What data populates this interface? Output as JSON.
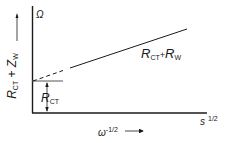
{
  "diagram": {
    "y_axis": {
      "unit": "Ω",
      "label_main": "R",
      "label_sub1": "CT",
      "label_plus": " + ",
      "label_main2": "Z",
      "label_sub2": "W"
    },
    "x_axis": {
      "label_main": "ω",
      "label_sup": "-1/2",
      "unit_main": "s",
      "unit_sup": "1/2"
    },
    "line_label": {
      "r1": "R",
      "r1_sub": "CT",
      "plus": "+",
      "r2": "R",
      "r2_sub": "W"
    },
    "intercept_label": {
      "main": "R",
      "sub": "CT"
    },
    "colors": {
      "ink": "#1a1a1a",
      "background": "#ffffff"
    }
  }
}
